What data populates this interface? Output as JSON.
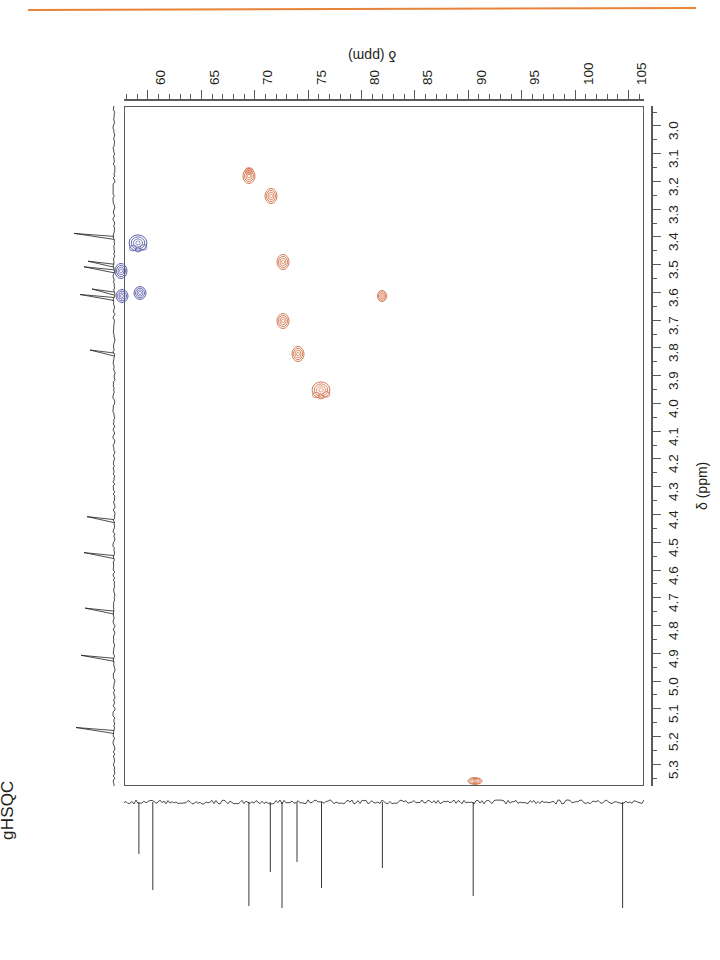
{
  "figure": {
    "title": "gHSQC",
    "accent_rule_color": "#e8833a",
    "rotation_note": "page content rotated 90 degrees",
    "axis_label_x": "δ (ppm)",
    "axis_label_y": "δ (ppm)"
  },
  "chart_data": {
    "type": "scatter",
    "title": "gHSQC",
    "xlabel": "δ (ppm)",
    "ylabel": "δ (ppm)",
    "xlim": [
      57.8,
      106.5
    ],
    "ylim": [
      2.93,
      5.38
    ],
    "x_axis_position": "top",
    "y_axis_position": "right",
    "x_axis_inverted": false,
    "y_axis_inverted": false,
    "grid": false,
    "legend": "none",
    "x_ticks_major": [
      60,
      65,
      70,
      75,
      80,
      85,
      90,
      95,
      100,
      105
    ],
    "x_tick_labels": [
      "60",
      "65",
      "70",
      "75",
      "80",
      "85",
      "90",
      "95",
      "100",
      "105"
    ],
    "x_ticks_minor_step": 1,
    "y_ticks_major": [
      3.0,
      3.1,
      3.2,
      3.3,
      3.4,
      3.5,
      3.6,
      3.7,
      3.8,
      3.9,
      4.0,
      4.1,
      4.2,
      4.3,
      4.4,
      4.5,
      4.6,
      4.7,
      4.8,
      4.9,
      5.0,
      5.1,
      5.2,
      5.3
    ],
    "y_tick_labels": [
      "3.0",
      "3.1",
      "3.2",
      "3.3",
      "3.4",
      "3.5",
      "3.6",
      "3.7",
      "3.8",
      "3.9",
      "4.0",
      "4.1",
      "4.2",
      "4.3",
      "4.4",
      "4.5",
      "4.6",
      "4.7",
      "4.8",
      "4.9",
      "5.0",
      "5.1",
      "5.2",
      "5.3"
    ],
    "series": [
      {
        "name": "positive contours (CH)",
        "color": "#d4784f",
        "points": [
          {
            "x": 69.4,
            "y": 3.18,
            "size": "medium",
            "shape": "double"
          },
          {
            "x": 71.5,
            "y": 3.25,
            "size": "medium",
            "shape": "oval"
          },
          {
            "x": 72.6,
            "y": 3.49,
            "size": "medium",
            "shape": "oval"
          },
          {
            "x": 72.6,
            "y": 3.7,
            "size": "medium",
            "shape": "oval"
          },
          {
            "x": 74.0,
            "y": 3.82,
            "size": "medium",
            "shape": "oval"
          },
          {
            "x": 76.2,
            "y": 3.95,
            "size": "large",
            "shape": "cluster"
          },
          {
            "x": 81.9,
            "y": 3.61,
            "size": "small",
            "shape": "oval"
          },
          {
            "x": 90.6,
            "y": 5.36,
            "size": "small",
            "shape": "wide"
          }
        ]
      },
      {
        "name": "negative contours (CH2)",
        "color": "#5b5fa8",
        "points": [
          {
            "x": 59.0,
            "y": 3.42,
            "size": "large",
            "shape": "cluster"
          },
          {
            "x": 57.4,
            "y": 3.52,
            "size": "medium",
            "shape": "oval"
          },
          {
            "x": 59.2,
            "y": 3.6,
            "size": "medium",
            "shape": "round"
          },
          {
            "x": 57.5,
            "y": 3.61,
            "size": "medium",
            "shape": "round"
          }
        ]
      }
    ],
    "projections": [
      {
        "name": "carbon-1d-projection",
        "axis": "x",
        "position": "bottom",
        "direction": "negative-going peaks",
        "peaks_ppm": [
          59.2,
          60.5,
          69.5,
          71.5,
          72.6,
          74.0,
          76.3,
          82.0,
          90.5,
          104.5
        ]
      },
      {
        "name": "proton-1d-projection",
        "axis": "y",
        "position": "left",
        "direction": "positive-going peaks",
        "peaks_ppm": [
          3.4,
          3.5,
          3.52,
          3.6,
          3.62,
          3.82,
          4.42,
          4.55,
          4.75,
          4.92,
          5.18
        ]
      }
    ]
  }
}
